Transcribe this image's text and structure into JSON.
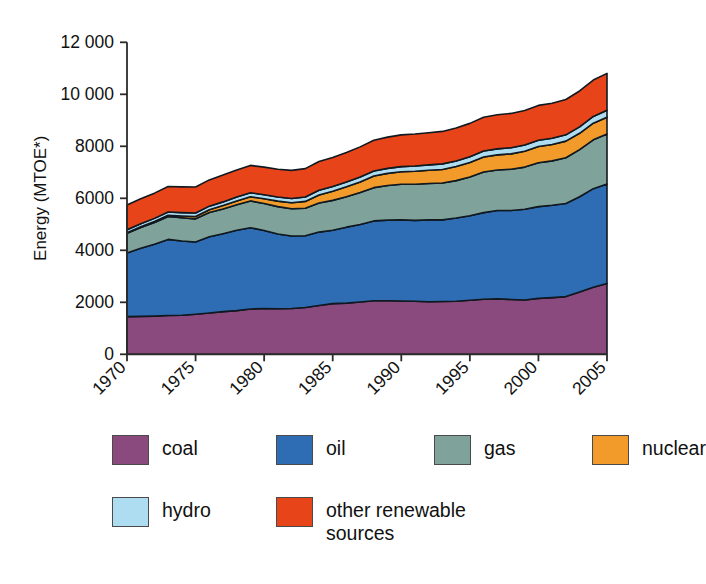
{
  "chart_data": {
    "type": "area",
    "title": "",
    "xlabel": "",
    "ylabel": "Energy (MTOE*)",
    "stacked": true,
    "grid": false,
    "legend_position": "bottom",
    "xlim": [
      1970,
      2005
    ],
    "ylim": [
      0,
      12000
    ],
    "ytick_labels": [
      "0",
      "2000",
      "4000",
      "6000",
      "8000",
      "10 000",
      "12 000"
    ],
    "ytick_values": [
      0,
      2000,
      4000,
      6000,
      8000,
      10000,
      12000
    ],
    "xtick_labels": [
      "1970",
      "1975",
      "1980",
      "1985",
      "1990",
      "1995",
      "2000",
      "2005"
    ],
    "xtick_values": [
      1970,
      1975,
      1980,
      1985,
      1990,
      1995,
      2000,
      2005
    ],
    "x": [
      1970,
      1971,
      1972,
      1973,
      1974,
      1975,
      1976,
      1977,
      1978,
      1979,
      1980,
      1981,
      1982,
      1983,
      1984,
      1985,
      1986,
      1987,
      1988,
      1989,
      1990,
      1991,
      1992,
      1993,
      1994,
      1995,
      1996,
      1997,
      1998,
      1999,
      2000,
      2001,
      2002,
      2003,
      2004,
      2005
    ],
    "series": [
      {
        "name": "coal",
        "color": "#8B4A7D",
        "values": [
          1450,
          1460,
          1470,
          1490,
          1500,
          1540,
          1590,
          1640,
          1680,
          1740,
          1760,
          1750,
          1760,
          1800,
          1880,
          1950,
          1970,
          2010,
          2060,
          2060,
          2050,
          2040,
          2020,
          2030,
          2040,
          2080,
          2120,
          2130,
          2110,
          2090,
          2150,
          2180,
          2220,
          2400,
          2580,
          2720
        ]
      },
      {
        "name": "oil",
        "color": "#2E6DB4",
        "values": [
          2450,
          2620,
          2760,
          2930,
          2860,
          2780,
          2930,
          3000,
          3090,
          3130,
          3000,
          2880,
          2790,
          2760,
          2820,
          2820,
          2920,
          2980,
          3070,
          3100,
          3120,
          3110,
          3150,
          3140,
          3200,
          3250,
          3330,
          3400,
          3420,
          3490,
          3530,
          3550,
          3580,
          3660,
          3790,
          3830
        ]
      },
      {
        "name": "gas",
        "color": "#7FA39B",
        "values": [
          760,
          800,
          840,
          880,
          890,
          890,
          930,
          950,
          980,
          1030,
          1040,
          1050,
          1050,
          1060,
          1120,
          1150,
          1170,
          1230,
          1280,
          1330,
          1370,
          1390,
          1400,
          1420,
          1440,
          1490,
          1560,
          1560,
          1590,
          1620,
          1690,
          1710,
          1760,
          1810,
          1880,
          1920
        ]
      },
      {
        "name": "nuclear",
        "color": "#F39B2A",
        "values": [
          20,
          30,
          40,
          50,
          70,
          90,
          110,
          130,
          150,
          160,
          180,
          210,
          230,
          260,
          310,
          350,
          380,
          410,
          450,
          470,
          480,
          500,
          510,
          520,
          540,
          560,
          580,
          580,
          590,
          610,
          620,
          630,
          640,
          630,
          640,
          650
        ]
      },
      {
        "name": "hydro",
        "color": "#AEDCF0",
        "values": [
          110,
          115,
          118,
          122,
          128,
          135,
          138,
          142,
          150,
          155,
          158,
          160,
          165,
          172,
          178,
          182,
          186,
          188,
          192,
          192,
          198,
          204,
          204,
          213,
          215,
          222,
          230,
          232,
          235,
          238,
          243,
          238,
          241,
          248,
          258,
          265
        ]
      },
      {
        "name": "other renewable sources",
        "color": "#E8441A",
        "values": [
          950,
          960,
          970,
          980,
          990,
          1000,
          1010,
          1030,
          1040,
          1050,
          1060,
          1070,
          1080,
          1090,
          1110,
          1120,
          1140,
          1160,
          1180,
          1200,
          1220,
          1230,
          1240,
          1250,
          1270,
          1280,
          1300,
          1310,
          1320,
          1330,
          1340,
          1350,
          1360,
          1380,
          1400,
          1420
        ]
      }
    ],
    "totals_at_ticks": {
      "1970": 5740,
      "1975": 6425,
      "1980": 7200,
      "1985": 7570,
      "1990": 8440,
      "1995": 8880,
      "2000": 9570,
      "2005": 10800
    }
  },
  "axis": {
    "y_title": "Energy (MTOE*)"
  },
  "legend": {
    "rows": [
      [
        {
          "label": "coal",
          "color": "#8B4A7D",
          "swatch_name": "legend-swatch-coal"
        },
        {
          "label": "oil",
          "color": "#2E6DB4",
          "swatch_name": "legend-swatch-oil"
        },
        {
          "label": "gas",
          "color": "#7FA39B",
          "swatch_name": "legend-swatch-gas"
        },
        {
          "label": "nuclear",
          "color": "#F39B2A",
          "swatch_name": "legend-swatch-nuclear"
        }
      ],
      [
        {
          "label": "hydro",
          "color": "#AEDCF0",
          "swatch_name": "legend-swatch-hydro"
        },
        {
          "label": "other renewable\nsources",
          "color": "#E8441A",
          "swatch_name": "legend-swatch-other-renewable"
        }
      ]
    ]
  },
  "colors": {
    "coal": "#8B4A7D",
    "oil": "#2E6DB4",
    "gas": "#7FA39B",
    "nuclear": "#F39B2A",
    "hydro": "#AEDCF0",
    "other_renewable": "#E8441A",
    "axis": "#2b2b2b",
    "outline": "#101820",
    "background": "#ffffff"
  }
}
